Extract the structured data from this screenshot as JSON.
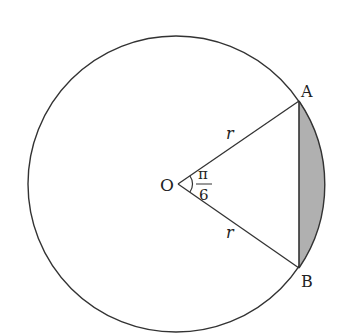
{
  "diagram": {
    "type": "circle-segment",
    "colors": {
      "stroke": "#333333",
      "shade": "#b0b0b0",
      "background": "#ffffff"
    },
    "labels": {
      "center": "O",
      "point_a": "A",
      "point_b": "B",
      "radius_top": "r",
      "radius_bottom": "r",
      "angle_numerator": "π",
      "angle_denominator": "6"
    }
  }
}
